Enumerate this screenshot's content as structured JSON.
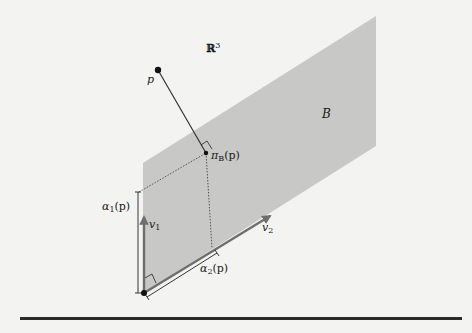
{
  "figure": {
    "space_label": {
      "base": "ℝ",
      "exponent": "3"
    },
    "plane_label": "B",
    "point_label": "p",
    "projection_label": {
      "base": "π",
      "sub": "B",
      "arg": "(p)"
    },
    "basis_vectors": [
      {
        "name": "v",
        "sub": "1"
      },
      {
        "name": "v",
        "sub": "2"
      }
    ],
    "coefficients": [
      {
        "base": "α",
        "sub": "1",
        "arg": "(p)"
      },
      {
        "base": "α",
        "sub": "2",
        "arg": "(p)"
      }
    ]
  },
  "colors": {
    "background": "#f3f3f1",
    "plane": "#c8c8c6",
    "vector": "#6e6e6e",
    "ink": "#1a1a1a"
  }
}
